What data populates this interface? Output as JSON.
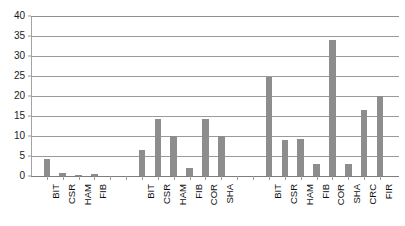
{
  "chart_data": {
    "type": "bar",
    "title": "",
    "subtitle": "",
    "xlabel": "",
    "ylabel": "",
    "ylim": [
      0,
      40
    ],
    "ytick_labels": [
      "0",
      "5",
      "10",
      "15",
      "20",
      "25",
      "30",
      "35",
      "40"
    ],
    "ytick_values": [
      0,
      5,
      10,
      15,
      20,
      25,
      30,
      35,
      40
    ],
    "grid": true,
    "legend": false,
    "legend_position": "none",
    "bar_color": "#8d8d8d",
    "grid_color": "#9a9a9a",
    "axis_color": "#a3a3a3",
    "groups": [
      {
        "name": "group-1",
        "categories": [
          "BIT",
          "CSR",
          "HAM",
          "FIB"
        ],
        "values": [
          4.2,
          0.8,
          0.2,
          0.5
        ]
      },
      {
        "name": "group-2",
        "categories": [
          "BIT",
          "CSR",
          "HAM",
          "FIB",
          "COR",
          "SHA"
        ],
        "values": [
          6.4,
          14.2,
          10.0,
          2.0,
          14.2,
          10.0
        ]
      },
      {
        "name": "group-3",
        "categories": [
          "BIT",
          "CSR",
          "HAM",
          "FIB",
          "COR",
          "SHA",
          "CRC",
          "FIR"
        ],
        "values": [
          24.7,
          9.0,
          9.2,
          3.1,
          34.0,
          3.1,
          16.6,
          20.0
        ]
      }
    ],
    "categories": [
      "BIT",
      "CSR",
      "HAM",
      "FIB",
      "BIT",
      "CSR",
      "HAM",
      "FIB",
      "COR",
      "SHA",
      "BIT",
      "CSR",
      "HAM",
      "FIB",
      "COR",
      "SHA",
      "CRC",
      "FIR"
    ],
    "values": [
      4.2,
      0.8,
      0.2,
      0.5,
      6.4,
      14.2,
      10.0,
      2.0,
      14.2,
      10.0,
      24.7,
      9.0,
      9.2,
      3.1,
      34.0,
      3.1,
      16.6,
      20.0
    ]
  }
}
